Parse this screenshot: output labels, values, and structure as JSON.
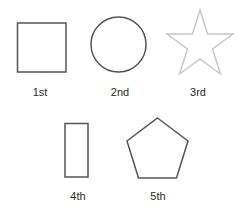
{
  "shapes": [
    {
      "id": "square",
      "label": "1st",
      "stroke": "#555555"
    },
    {
      "id": "circle",
      "label": "2nd",
      "stroke": "#555555"
    },
    {
      "id": "star",
      "label": "3rd",
      "stroke": "#c8c8c8"
    },
    {
      "id": "rectangle",
      "label": "4th",
      "stroke": "#555555"
    },
    {
      "id": "pentagon",
      "label": "5th",
      "stroke": "#555555"
    }
  ]
}
